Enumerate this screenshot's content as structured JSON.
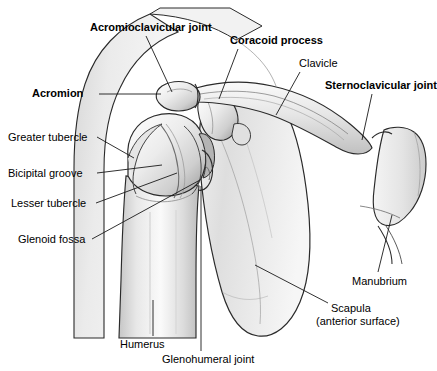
{
  "figure": {
    "background_color": "#ffffff",
    "line_color": "#1a1a1a",
    "label_color": "#000000",
    "bone_fill_light": "#f2f2f2",
    "bone_fill_mid": "#dcdcdc",
    "bone_fill_dark": "#bfbfbf"
  },
  "labels": [
    {
      "id": "acromioclavicular-joint",
      "text": "Acromioclavicular joint",
      "bold": true,
      "x": 90,
      "y": 21
    },
    {
      "id": "coracoid-process",
      "text": "Coracoid process",
      "bold": true,
      "x": 230,
      "y": 34
    },
    {
      "id": "clavicle",
      "text": "Clavicle",
      "bold": false,
      "x": 299,
      "y": 57
    },
    {
      "id": "acromion",
      "text": "Acromion",
      "bold": true,
      "x": 32,
      "y": 87
    },
    {
      "id": "sternoclavicular-joint",
      "text": "Sternoclavicular joint",
      "bold": true,
      "x": 325,
      "y": 79
    },
    {
      "id": "greater-tubercle",
      "text": "Greater tubercle",
      "bold": false,
      "x": 8,
      "y": 131
    },
    {
      "id": "bicipital-groove",
      "text": "Bicipital groove",
      "bold": false,
      "x": 8,
      "y": 167
    },
    {
      "id": "lesser-tubercle",
      "text": "Lesser tubercle",
      "bold": false,
      "x": 11,
      "y": 197
    },
    {
      "id": "glenoid-fossa",
      "text": "Glenoid fossa",
      "bold": false,
      "x": 18,
      "y": 233
    },
    {
      "id": "manubrium",
      "text": "Manubrium",
      "bold": false,
      "x": 352,
      "y": 275
    },
    {
      "id": "scapula",
      "text": "Scapula",
      "bold": false,
      "x": 331,
      "y": 302
    },
    {
      "id": "scapula-sub",
      "text": "(anterior surface)",
      "bold": false,
      "x": 316,
      "y": 315
    },
    {
      "id": "humerus",
      "text": "Humerus",
      "bold": false,
      "x": 120,
      "y": 338
    },
    {
      "id": "glenohumeral-joint",
      "text": "Glenohumeral joint",
      "bold": false,
      "x": 162,
      "y": 353
    }
  ],
  "leader_lines": [
    {
      "id": "leader-acromioclavicular-joint",
      "from": [
        146,
        36
      ],
      "to": [
        172,
        92
      ]
    },
    {
      "id": "leader-coracoid-process",
      "from": [
        238,
        49
      ],
      "to": [
        219,
        99
      ]
    },
    {
      "id": "leader-clavicle",
      "from": [
        300,
        72
      ],
      "to": [
        276,
        115
      ]
    },
    {
      "id": "leader-acromion",
      "from": [
        99,
        94
      ],
      "to": [
        161,
        94
      ]
    },
    {
      "id": "leader-sternoclavicular-joint",
      "from": [
        372,
        94
      ],
      "to": [
        362,
        140
      ]
    },
    {
      "id": "leader-greater-tubercle",
      "from": [
        97,
        137
      ],
      "to": [
        134,
        158
      ]
    },
    {
      "id": "leader-bicipital-groove",
      "from": [
        97,
        173
      ],
      "to": [
        162,
        165
      ]
    },
    {
      "id": "leader-lesser-tubercle",
      "from": [
        96,
        203
      ],
      "to": [
        177,
        173
      ]
    },
    {
      "id": "leader-glenoid-fossa",
      "from": [
        92,
        239
      ],
      "to": [
        200,
        180
      ]
    },
    {
      "id": "leader-manubrium",
      "from": [
        378,
        272
      ],
      "to": [
        392,
        215
      ]
    },
    {
      "id": "leader-scapula",
      "from": [
        328,
        303
      ],
      "to": [
        255,
        265
      ]
    },
    {
      "id": "leader-humerus",
      "from": [
        153,
        336
      ],
      "to": [
        153,
        300
      ]
    },
    {
      "id": "leader-glenohumeral-joint",
      "from": [
        201,
        351
      ],
      "to": [
        201,
        186
      ]
    }
  ],
  "structures": [
    {
      "id": "clavicle-bone",
      "name": "clavicle"
    },
    {
      "id": "acromion-bone",
      "name": "acromion"
    },
    {
      "id": "coracoid-bone",
      "name": "coracoid process"
    },
    {
      "id": "scapula-bone",
      "name": "scapula anterior surface"
    },
    {
      "id": "humerus-bone",
      "name": "humerus"
    },
    {
      "id": "humeral-head",
      "name": "head of humerus"
    },
    {
      "id": "greater-tubercle-bone",
      "name": "greater tubercle"
    },
    {
      "id": "lesser-tubercle-bone",
      "name": "lesser tubercle"
    },
    {
      "id": "bicipital-groove-bone",
      "name": "bicipital (intertubercular) groove"
    },
    {
      "id": "manubrium-bone",
      "name": "manubrium of sternum"
    },
    {
      "id": "rib-bone",
      "name": "first rib / costal cartilage"
    },
    {
      "id": "soft-tissue-outline",
      "name": "deltoid soft tissue contour"
    }
  ]
}
